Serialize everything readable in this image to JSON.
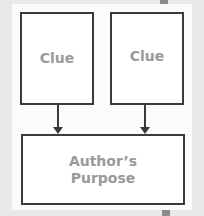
{
  "diagram": {
    "clue_boxes": [
      {
        "label": "Clue"
      },
      {
        "label": "Clue"
      }
    ],
    "result_box": {
      "label_line1": "Author’s",
      "label_line2": "Purpose"
    },
    "colors": {
      "border": "#3a3a3a",
      "text": "#9a9a9a",
      "panel": "#fbfbfb",
      "background": "#e9e9e9"
    }
  }
}
